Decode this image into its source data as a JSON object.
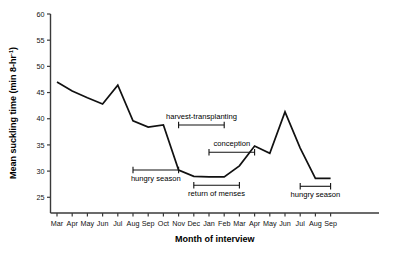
{
  "chart_data": {
    "type": "line",
    "title": "",
    "xlabel": "Month of interview",
    "ylabel": "Mean suckling time (min 8-hr",
    "ylabel_sup": "-1",
    "ylabel_tail": ")",
    "categories": [
      "Mar",
      "Apr",
      "May",
      "Jun",
      "Jul",
      "Aug",
      "Sep",
      "Oct",
      "Nov",
      "Dec",
      "Jan",
      "Feb",
      "Mar",
      "Apr",
      "May",
      "Jun",
      "Jul",
      "Aug",
      "Sep"
    ],
    "values": [
      47.0,
      45.3,
      44.0,
      42.8,
      46.4,
      39.6,
      38.4,
      38.8,
      30.2,
      29.0,
      28.9,
      28.9,
      31.0,
      34.8,
      33.4,
      41.3,
      34.4,
      28.6,
      28.6
    ],
    "ylim": [
      22,
      60
    ],
    "yticks": [
      25,
      30,
      35,
      40,
      45,
      50,
      55,
      60
    ],
    "ytick_labels": [
      "25",
      "30",
      "35",
      "40",
      "45",
      "50",
      "55",
      "60"
    ],
    "grid": false,
    "legend": "none",
    "annotations": [
      {
        "label": "hungry season",
        "start_month": "Aug",
        "end_month": "Nov",
        "value": 30.2,
        "text_side": "below"
      },
      {
        "label": "harvest-transplanting",
        "start_month": "Nov",
        "end_month": "Feb",
        "value": 38.8,
        "text_side": "above"
      },
      {
        "label": "return of menses",
        "start_month": "Dec",
        "end_month": "Mar",
        "value": 27.3,
        "text_side": "below"
      },
      {
        "label": "conception",
        "start_month": "Jan",
        "end_month": "Apr",
        "value": 33.6,
        "text_side": "above"
      },
      {
        "label": "hungry season",
        "start_month": "Jul",
        "end_month": "Sep",
        "value": 27.1,
        "text_side": "below"
      }
    ]
  }
}
